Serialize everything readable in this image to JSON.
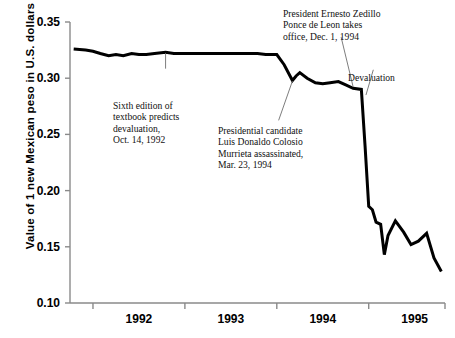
{
  "chart_data": {
    "type": "line",
    "title": "",
    "xlabel": "",
    "ylabel": "Value of 1 new Mexican peso in U.S. dollars",
    "ylim": [
      0.1,
      0.35
    ],
    "yticks": [
      0.1,
      0.15,
      0.2,
      0.25,
      0.3,
      0.35
    ],
    "ytick_labels": [
      "0.10",
      "0.15",
      "0.20",
      "0.25",
      "0.30",
      "0.35"
    ],
    "xlim": [
      1991.75,
      1995.83
    ],
    "xticks": [
      1992.0,
      1993.0,
      1994.0,
      1995.0
    ],
    "xtick_labels": [
      "1992",
      "1993",
      "1994",
      "1995"
    ],
    "xtick_label_placement": "between-ticks",
    "grid": false,
    "legend": null,
    "line_color": "#000000",
    "line_width": 3.0,
    "series": [
      {
        "name": "New Mexican peso in U.S. dollars",
        "x": [
          1991.79,
          1991.92,
          1992.0,
          1992.08,
          1992.17,
          1992.25,
          1992.33,
          1992.42,
          1992.5,
          1992.58,
          1992.67,
          1992.79,
          1992.88,
          1993.0,
          1993.13,
          1993.25,
          1993.38,
          1993.5,
          1993.58,
          1993.67,
          1993.79,
          1993.88,
          1994.0,
          1994.08,
          1994.17,
          1994.21,
          1994.25,
          1994.33,
          1994.42,
          1994.5,
          1994.58,
          1994.67,
          1994.75,
          1994.83,
          1994.92,
          1994.96,
          1995.0,
          1995.04,
          1995.08,
          1995.13,
          1995.17,
          1995.21,
          1995.29,
          1995.38,
          1995.46,
          1995.54,
          1995.63,
          1995.71,
          1995.79
        ],
        "y": [
          0.326,
          0.325,
          0.324,
          0.322,
          0.32,
          0.321,
          0.32,
          0.322,
          0.321,
          0.321,
          0.322,
          0.323,
          0.322,
          0.322,
          0.322,
          0.322,
          0.322,
          0.322,
          0.322,
          0.322,
          0.322,
          0.321,
          0.321,
          0.312,
          0.298,
          0.302,
          0.305,
          0.3,
          0.296,
          0.295,
          0.296,
          0.297,
          0.294,
          0.291,
          0.29,
          0.24,
          0.186,
          0.183,
          0.172,
          0.17,
          0.143,
          0.16,
          0.173,
          0.163,
          0.152,
          0.155,
          0.162,
          0.14,
          0.128
        ],
        "description": "Daily/weekly exchange rate of 1 new Mexican peso in U.S. dollars, late 1991 through late 1995, showing the December 1994 devaluation."
      }
    ],
    "annotations": [
      {
        "id": "textbook-prediction",
        "text": "Sixth edition of\ntextbook predicts\ndevaluation,\nOct. 14, 1992",
        "event_date": "Oct. 14, 1992",
        "leader_from": [
          1992.79,
          0.3225
        ],
        "leader_to": [
          1992.79,
          0.3085
        ]
      },
      {
        "id": "colosio-assassination",
        "text": "Presidential candidate\nLuis Donaldo Colosio\nMurrieta assassinated,\nMar. 23, 1994",
        "event_date": "Mar. 23, 1994",
        "leader_from": [
          1994.17,
          0.2975
        ],
        "leader_to": [
          1994.02,
          0.2625
        ]
      },
      {
        "id": "zedillo-takes-office",
        "text": "President Ernesto Zedillo\nPonce de Leon takes\noffice, Dec. 1, 1994",
        "event_date": "Dec. 1, 1994",
        "leader_from": [
          1994.7,
          0.3365
        ],
        "leader_to": [
          1994.83,
          0.2925
        ]
      },
      {
        "id": "devaluation",
        "text": "Devaluation",
        "event_date": "Dec. 1994",
        "leader_from": [
          1995.05,
          0.3075
        ],
        "leader_to": [
          1994.97,
          0.285
        ]
      }
    ]
  }
}
